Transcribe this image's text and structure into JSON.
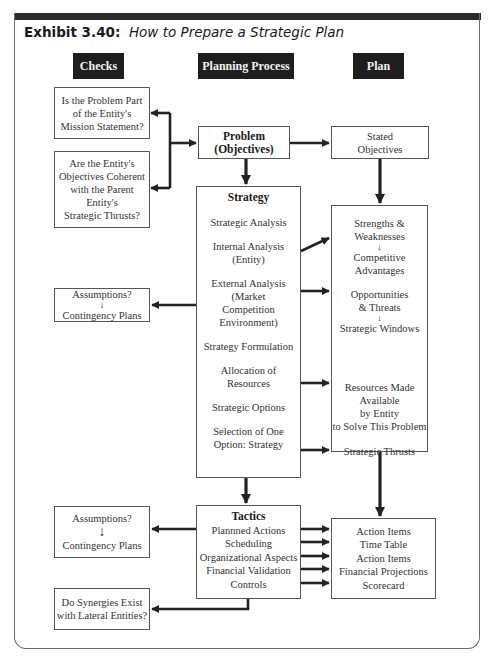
{
  "title": {
    "prefix": "Exhibit 3.40:",
    "text": "How to Prepare a Strategic Plan"
  },
  "headers": {
    "checks": "Checks",
    "process": "Planning Process",
    "plan": "Plan"
  },
  "checks": {
    "mission": "Is the Problem Part\nof the Entity's\nMission Statement?",
    "coherent": "Are the Entity's\nObjectives Coherent\nwith the Parent\nEntity's\nStrategic Thrusts?",
    "assumptions1_top": "Assumptions?",
    "assumptions1_bottom": "Contingency Plans",
    "assumptions2_top": "Assumptions?",
    "assumptions2_bottom": "Contingency Plans",
    "synergies": "Do Synergies Exist\nwith Lateral Entities?"
  },
  "process": {
    "problem": "Problem\n(Objectives)",
    "strategy": {
      "heading": "Strategy",
      "items": [
        "Strategic Analysis",
        "Internal Analysis\n(Entity)",
        "External Analysis\n(Market\nCompetition\nEnvironment)",
        "Strategy Formulation",
        "Allocation of\nResources",
        "Strategic Options",
        "Selection of One\nOption: Strategy"
      ]
    },
    "tactics": {
      "heading": "Tactics",
      "items": [
        "Plannned Actions",
        "Scheduling",
        "Organizational Aspects",
        "Financial Validation",
        "Controls"
      ]
    }
  },
  "plan": {
    "stated_objectives": "Stated\nObjectives",
    "strategy_outputs": {
      "strengths": "Strengths &\nWeaknesses",
      "competitive": "Competitive\nAdvantages",
      "opportunities": "Opportunities\n& Threats",
      "windows": "Strategic Windows",
      "resources": "Resources Made\nAvailable\nby Entity\nto Solve This Problem",
      "thrusts": "Strategic Thrusts"
    },
    "tactics_outputs": [
      "Action Items",
      "Time Table",
      "Action Items",
      "Financial Projections",
      "Scorecard"
    ]
  },
  "colors": {
    "header_bg": "#1e1e1e",
    "header_text": "#f2f2f2",
    "arrow": "#222222",
    "box_border": "#555555"
  }
}
